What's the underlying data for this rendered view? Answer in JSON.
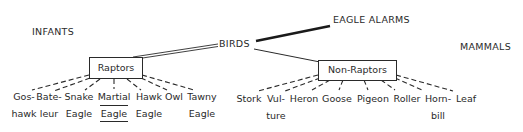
{
  "diagram": {
    "root": "BIRDS",
    "corner_labels": {
      "infants": "INFANTS",
      "eagle_alarms": "EAGLE ALARMS",
      "mammals": "MAMMALS"
    },
    "categories": [
      {
        "label": "Raptors",
        "children": [
          {
            "line1": "Gos-",
            "line2": "hawk"
          },
          {
            "line1": "Bate-",
            "line2": "leur"
          },
          {
            "line1": "Snake",
            "line2": "Eagle"
          },
          {
            "line1": "Martial",
            "line2": "Eagle",
            "underlined": true
          },
          {
            "line1": "Hawk",
            "line2": "Eagle"
          },
          {
            "line1": "Owl",
            "line2": ""
          },
          {
            "line1": "Tawny",
            "line2": "Eagle"
          }
        ]
      },
      {
        "label": "Non-Raptors",
        "children": [
          {
            "line1": "Stork",
            "line2": ""
          },
          {
            "line1": "Vul-",
            "line2": "ture"
          },
          {
            "line1": "Heron",
            "line2": ""
          },
          {
            "line1": "Goose",
            "line2": ""
          },
          {
            "line1": "Pigeon",
            "line2": ""
          },
          {
            "line1": "Roller",
            "line2": ""
          },
          {
            "line1": "Horn-",
            "line2": "bill"
          },
          {
            "line1": "Leaf",
            "line2": ""
          }
        ]
      }
    ],
    "edges": [
      {
        "from": "BIRDS",
        "to": "Raptors",
        "style": "double-line"
      },
      {
        "from": "BIRDS",
        "to": "EAGLE ALARMS",
        "style": "thick-line"
      },
      {
        "from": "BIRDS",
        "to": "Non-Raptors",
        "style": "thin-line"
      },
      {
        "from": "Raptors",
        "to": "children",
        "style": "dashed"
      },
      {
        "from": "Non-Raptors",
        "to": "children",
        "style": "dashed"
      }
    ]
  }
}
